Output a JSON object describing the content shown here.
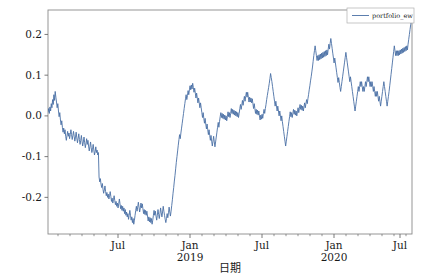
{
  "figure": {
    "background": "#ffffff",
    "width": 424,
    "height": 280
  },
  "axis_labels": {
    "y": "累计收益率",
    "x": "日期"
  },
  "legend": {
    "entries": [
      "portfolio_ew"
    ],
    "position": "upper right"
  },
  "colors": {
    "line": "#4a6fa5",
    "axis": "#6b6b6b",
    "text": "#1a1a1a",
    "background": "#ffffff"
  },
  "chart_data": {
    "type": "line",
    "title": "",
    "xlabel": "日期",
    "ylabel": "累计收益率",
    "grid": false,
    "legend_position": "upper right",
    "xlim": [
      "2018-03-01",
      "2020-09-15"
    ],
    "ylim": [
      -0.29,
      0.26
    ],
    "yticks": [
      0.2,
      0.1,
      0.0,
      -0.1,
      -0.2
    ],
    "ytick_labels": [
      "0.2",
      "0.1",
      "0.0",
      "-0.1",
      "-0.2"
    ],
    "xticks": [
      "2018-07",
      "2019-01",
      "2019-07",
      "2020-01",
      "2020-07"
    ],
    "xtick_labels": [
      "Jul",
      "Jan\n2019",
      "Jul",
      "Jan\n2020",
      "Jul"
    ],
    "xtick_major": [
      "Jul",
      "Jan",
      "Jul",
      "Jan",
      "Jul"
    ],
    "xtick_year": [
      "",
      "2019",
      "",
      "2020",
      ""
    ],
    "minor_tick_interval_months": 1,
    "series": [
      {
        "name": "portfolio_ew",
        "color": "#4a6fa5",
        "linewidth": 0.9,
        "values": [
          0.01,
          0.018,
          0.006,
          0.022,
          0.012,
          0.03,
          0.02,
          0.04,
          0.028,
          0.052,
          0.038,
          0.06,
          0.046,
          0.034,
          0.02,
          0.03,
          0.012,
          -0.002,
          0.008,
          -0.01,
          -0.022,
          -0.012,
          -0.028,
          -0.04,
          -0.03,
          -0.044,
          -0.034,
          -0.05,
          -0.06,
          -0.048,
          -0.038,
          -0.05,
          -0.042,
          -0.056,
          -0.046,
          -0.034,
          -0.046,
          -0.058,
          -0.048,
          -0.038,
          -0.05,
          -0.062,
          -0.052,
          -0.04,
          -0.054,
          -0.066,
          -0.056,
          -0.044,
          -0.058,
          -0.07,
          -0.06,
          -0.048,
          -0.062,
          -0.074,
          -0.064,
          -0.052,
          -0.066,
          -0.078,
          -0.068,
          -0.056,
          -0.07,
          -0.06,
          -0.074,
          -0.086,
          -0.076,
          -0.064,
          -0.078,
          -0.09,
          -0.082,
          -0.07,
          -0.084,
          -0.096,
          -0.088,
          -0.076,
          -0.09,
          -0.084,
          -0.096,
          -0.09,
          -0.15,
          -0.162,
          -0.154,
          -0.168,
          -0.176,
          -0.166,
          -0.18,
          -0.19,
          -0.182,
          -0.172,
          -0.186,
          -0.196,
          -0.188,
          -0.2,
          -0.192,
          -0.204,
          -0.196,
          -0.186,
          -0.198,
          -0.21,
          -0.202,
          -0.214,
          -0.206,
          -0.196,
          -0.208,
          -0.218,
          -0.21,
          -0.222,
          -0.214,
          -0.226,
          -0.216,
          -0.204,
          -0.216,
          -0.228,
          -0.22,
          -0.232,
          -0.222,
          -0.234,
          -0.226,
          -0.24,
          -0.23,
          -0.244,
          -0.236,
          -0.248,
          -0.24,
          -0.254,
          -0.244,
          -0.232,
          -0.244,
          -0.256,
          -0.248,
          -0.262,
          -0.252,
          -0.266,
          -0.256,
          -0.244,
          -0.232,
          -0.222,
          -0.234,
          -0.224,
          -0.212,
          -0.224,
          -0.236,
          -0.226,
          -0.214,
          -0.226,
          -0.216,
          -0.228,
          -0.24,
          -0.23,
          -0.242,
          -0.232,
          -0.244,
          -0.234,
          -0.246,
          -0.258,
          -0.248,
          -0.26,
          -0.25,
          -0.262,
          -0.252,
          -0.266,
          -0.256,
          -0.244,
          -0.232,
          -0.244,
          -0.234,
          -0.246,
          -0.256,
          -0.244,
          -0.23,
          -0.242,
          -0.252,
          -0.24,
          -0.226,
          -0.238,
          -0.248,
          -0.236,
          -0.222,
          -0.234,
          -0.244,
          -0.254,
          -0.262,
          -0.252,
          -0.24,
          -0.25,
          -0.238,
          -0.224,
          -0.236,
          -0.246,
          -0.234,
          -0.22,
          -0.206,
          -0.19,
          -0.176,
          -0.16,
          -0.146,
          -0.13,
          -0.114,
          -0.1,
          -0.086,
          -0.072,
          -0.058,
          -0.046,
          -0.056,
          -0.042,
          -0.03,
          -0.018,
          -0.006,
          0.006,
          0.018,
          0.03,
          0.042,
          0.052,
          0.04,
          0.05,
          0.062,
          0.052,
          0.064,
          0.074,
          0.064,
          0.076,
          0.066,
          0.08,
          0.07,
          0.058,
          0.068,
          0.056,
          0.044,
          0.056,
          0.044,
          0.032,
          0.044,
          0.032,
          0.02,
          0.032,
          0.02,
          0.008,
          -0.004,
          0.008,
          -0.006,
          -0.018,
          -0.006,
          -0.02,
          -0.032,
          -0.02,
          -0.034,
          -0.046,
          -0.034,
          -0.048,
          -0.06,
          -0.048,
          -0.062,
          -0.074,
          -0.062,
          -0.05,
          -0.064,
          -0.076,
          -0.064,
          -0.052,
          -0.04,
          -0.028,
          -0.016,
          -0.028,
          -0.014,
          -0.002,
          0.008,
          -0.004,
          0.006,
          -0.006,
          0.004,
          -0.008,
          0.002,
          -0.01,
          0.0,
          -0.012,
          -0.002,
          0.01,
          -0.002,
          0.008,
          -0.004,
          0.006,
          0.018,
          0.006,
          0.016,
          0.004,
          0.014,
          0.002,
          0.012,
          0.0,
          0.01,
          -0.002,
          0.008,
          -0.004,
          0.006,
          0.018,
          0.028,
          0.016,
          0.026,
          0.038,
          0.026,
          0.038,
          0.048,
          0.036,
          0.048,
          0.058,
          0.046,
          0.058,
          0.046,
          0.034,
          0.046,
          0.034,
          0.044,
          0.032,
          0.042,
          0.03,
          0.018,
          0.03,
          0.018,
          0.006,
          0.016,
          0.004,
          0.014,
          0.002,
          0.012,
          0.0,
          -0.01,
          0.002,
          -0.008,
          0.004,
          -0.006,
          0.006,
          0.016,
          0.006,
          0.018,
          0.028,
          0.04,
          0.05,
          0.06,
          0.07,
          0.08,
          0.092,
          0.104,
          0.094,
          0.084,
          0.072,
          0.06,
          0.048,
          0.036,
          0.024,
          0.036,
          0.024,
          0.012,
          0.024,
          0.012,
          0.0,
          0.012,
          0.0,
          -0.012,
          0.0,
          -0.014,
          -0.026,
          -0.038,
          -0.05,
          -0.062,
          -0.074,
          -0.062,
          -0.05,
          -0.038,
          -0.026,
          -0.014,
          -0.002,
          0.01,
          -0.002,
          0.008,
          -0.004,
          0.006,
          0.016,
          0.004,
          0.014,
          0.002,
          0.012,
          0.0,
          0.01,
          0.02,
          0.008,
          0.018,
          0.028,
          0.016,
          0.026,
          0.014,
          0.024,
          0.012,
          0.022,
          0.032,
          0.02,
          0.03,
          0.04,
          0.03,
          0.042,
          0.052,
          0.064,
          0.074,
          0.086,
          0.096,
          0.108,
          0.12,
          0.134,
          0.148,
          0.16,
          0.172,
          0.16,
          0.148,
          0.136,
          0.148,
          0.136,
          0.15,
          0.138,
          0.152,
          0.14,
          0.154,
          0.142,
          0.156,
          0.144,
          0.158,
          0.146,
          0.16,
          0.148,
          0.162,
          0.15,
          0.164,
          0.176,
          0.164,
          0.178,
          0.19,
          0.178,
          0.166,
          0.154,
          0.142,
          0.13,
          0.142,
          0.13,
          0.118,
          0.106,
          0.094,
          0.082,
          0.094,
          0.082,
          0.07,
          0.06,
          0.072,
          0.084,
          0.096,
          0.108,
          0.12,
          0.132,
          0.144,
          0.156,
          0.144,
          0.132,
          0.12,
          0.108,
          0.096,
          0.084,
          0.096,
          0.084,
          0.072,
          0.06,
          0.048,
          0.036,
          0.024,
          0.012,
          0.024,
          0.036,
          0.048,
          0.06,
          0.072,
          0.06,
          0.072,
          0.084,
          0.072,
          0.084,
          0.072,
          0.06,
          0.072,
          0.06,
          0.072,
          0.084,
          0.072,
          0.084,
          0.096,
          0.084,
          0.096,
          0.084,
          0.072,
          0.084,
          0.072,
          0.084,
          0.072,
          0.06,
          0.072,
          0.06,
          0.048,
          0.06,
          0.048,
          0.06,
          0.048,
          0.036,
          0.048,
          0.036,
          0.024,
          0.036,
          0.048,
          0.06,
          0.072,
          0.084,
          0.072,
          0.06,
          0.048,
          0.036,
          0.024,
          0.036,
          0.048,
          0.06,
          0.074,
          0.088,
          0.102,
          0.116,
          0.13,
          0.144,
          0.158,
          0.172,
          0.16,
          0.148,
          0.16,
          0.148,
          0.16,
          0.148,
          0.16,
          0.15,
          0.162,
          0.152,
          0.164,
          0.154,
          0.166,
          0.156,
          0.168,
          0.158,
          0.17,
          0.16,
          0.172,
          0.162,
          0.176,
          0.188,
          0.2,
          0.212,
          0.224,
          0.236,
          0.244
        ]
      }
    ]
  }
}
